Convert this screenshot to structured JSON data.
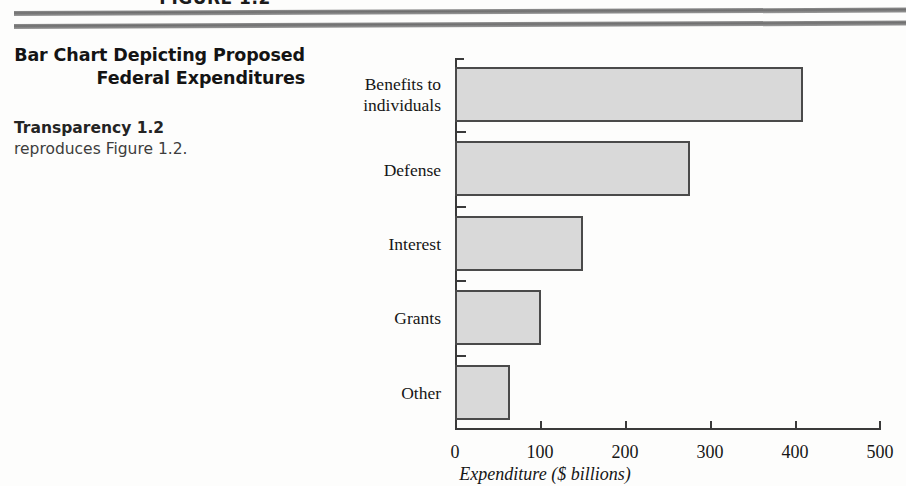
{
  "page": {
    "figure_label": "FIGURE 1.2"
  },
  "sidebar": {
    "heading": "Bar Chart Depicting Proposed Federal Expenditures",
    "body_lead": "Transparency 1.2",
    "body_rest": " reproduces Figure 1.2."
  },
  "colors": {
    "bar_fill": "#d9d9d9",
    "bar_stroke": "#4a4a4a",
    "axis": "#3a3a3a",
    "rule": "#7a7a7a",
    "text": "#161616"
  },
  "chart_data": {
    "type": "bar",
    "orientation": "horizontal",
    "title": "",
    "categories": [
      "Benefits to individuals",
      "Defense",
      "Interest",
      "Grants",
      "Other"
    ],
    "values": [
      409,
      276,
      150,
      101,
      65
    ],
    "xlabel": "Expenditure ($ billions)",
    "ylabel": "",
    "xlim": [
      0,
      500
    ],
    "xticks": [
      0,
      100,
      200,
      300,
      400,
      500
    ],
    "xtick_labels": [
      "0",
      "100",
      "200",
      "300",
      "400",
      "500"
    ],
    "grid": false,
    "legend": false
  }
}
